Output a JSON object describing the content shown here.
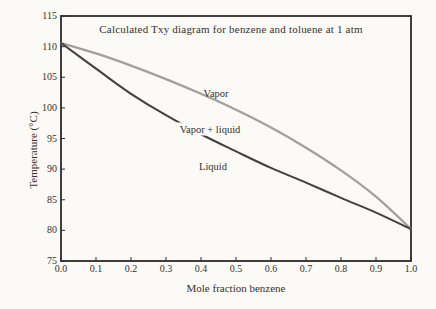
{
  "figure": {
    "title": "Calculated Txy diagram for benzene and toluene at 1 atm",
    "xlabel": "Mole fraction benzene",
    "ylabel": "Temperature (°C)",
    "labels": {
      "vapor": "Vapor",
      "two_phase": "Vapor + liquid",
      "liquid": "Liquid"
    }
  },
  "colors": {
    "background": "#fbfaf7",
    "frame": "#2b2a27",
    "text": "#36312b",
    "vapor_curve": "#a0a09d",
    "liquid_curve": "#424240"
  },
  "chart_data": {
    "type": "line",
    "title": "Calculated Txy diagram for benzene and toluene at 1 atm",
    "xlabel": "Mole fraction benzene",
    "ylabel": "Temperature (°C)",
    "xlim": [
      0.0,
      1.0
    ],
    "ylim": [
      75,
      115
    ],
    "grid": false,
    "legend": "inline-labels",
    "x_tick_labels": [
      "0.0",
      "0.1",
      "0.2",
      "0.3",
      "0.4",
      "0.5",
      "0.6",
      "0.7",
      "0.8",
      "0.9",
      "1.0"
    ],
    "y_tick_labels": [
      "75",
      "80",
      "85",
      "90",
      "95",
      "100",
      "105",
      "110",
      "115"
    ],
    "x": [
      0.0,
      0.1,
      0.2,
      0.3,
      0.4,
      0.5,
      0.6,
      0.7,
      0.8,
      0.9,
      1.0
    ],
    "series": [
      {
        "name": "Vapor",
        "values": [
          110.6,
          108.9,
          106.9,
          104.7,
          102.3,
          99.7,
          96.8,
          93.5,
          89.8,
          85.5,
          80.2
        ],
        "color": "#a0a09d",
        "width": 2.3
      },
      {
        "name": "Liquid",
        "values": [
          110.6,
          106.4,
          102.3,
          98.8,
          95.7,
          92.9,
          90.2,
          87.8,
          85.3,
          82.9,
          80.2
        ],
        "color": "#424240",
        "width": 2.1
      }
    ]
  }
}
